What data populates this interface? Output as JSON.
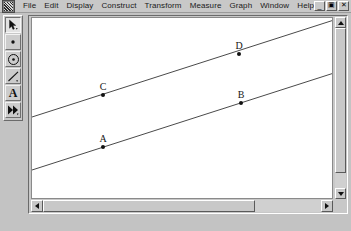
{
  "window": {
    "app_icon_name": "sketchpad-app-icon",
    "menus": [
      {
        "label": "File"
      },
      {
        "label": "Edit"
      },
      {
        "label": "Display"
      },
      {
        "label": "Construct"
      },
      {
        "label": "Transform"
      },
      {
        "label": "Measure"
      },
      {
        "label": "Graph"
      },
      {
        "label": "Window"
      },
      {
        "label": "Help"
      }
    ],
    "controls": {
      "minimize": "_",
      "restore": "▣",
      "close": "✕"
    }
  },
  "toolbox": {
    "tools": [
      {
        "id": "selection-arrow-tool",
        "label": "Selection Arrow Tool",
        "selected": true
      },
      {
        "id": "point-tool",
        "label": "Point Tool",
        "selected": false
      },
      {
        "id": "compass-circle-tool",
        "label": "Compass (Circle) Tool",
        "selected": false
      },
      {
        "id": "straightedge-tool",
        "label": "Straightedge Tool",
        "selected": false
      },
      {
        "id": "text-tool",
        "label": "Text Tool",
        "glyph": "A",
        "selected": false
      },
      {
        "id": "custom-tool",
        "label": "Custom Tool",
        "selected": false
      }
    ]
  },
  "canvas": {
    "background": "#ffffff",
    "stroke": "#4a4a4a",
    "point_color": "#111111",
    "label_color": "#161616",
    "lines": [
      {
        "id": "line-CD",
        "x1": 0,
        "y1": 99,
        "x2": 302,
        "y2": 2
      },
      {
        "id": "line-AB",
        "x1": 0,
        "y1": 152,
        "x2": 302,
        "y2": 55
      }
    ],
    "points": [
      {
        "id": "point-A",
        "label": "A",
        "x": 71,
        "y": 129,
        "label_dx": 0,
        "label_dy": -5
      },
      {
        "id": "point-B",
        "label": "B",
        "x": 209,
        "y": 85,
        "label_dx": 0,
        "label_dy": -5
      },
      {
        "id": "point-C",
        "label": "C",
        "x": 71,
        "y": 77,
        "label_dx": 0,
        "label_dy": -5
      },
      {
        "id": "point-D",
        "label": "D",
        "x": 207,
        "y": 36,
        "label_dx": 0,
        "label_dy": -5
      }
    ]
  },
  "scrollbars": {
    "vertical": {
      "up": "▲",
      "down": "▼"
    },
    "horizontal": {
      "left": "◀",
      "right": "▶"
    }
  }
}
